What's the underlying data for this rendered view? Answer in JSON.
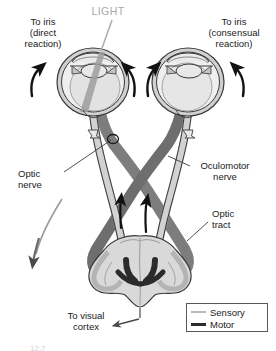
{
  "figure": {
    "background": "#ffffff"
  },
  "labels": {
    "light": "LIGHT",
    "to_iris_direct": "To iris\n(direct\nreaction)",
    "to_iris_consensual": "To iris\n(consensual\nreaction)",
    "optic_nerve": "Optic\nnerve",
    "oculomotor_nerve": "Oculomotor\nnerve",
    "optic_tract": "Optic\ntract",
    "to_visual_cortex": "To visual\ncortex"
  },
  "legend": {
    "position": "bottom-right",
    "items": [
      {
        "label": "Sensory",
        "color": "#b9b9b9",
        "kind": "sensory-line"
      },
      {
        "label": "Motor",
        "color": "#2b2b2b",
        "kind": "motor-line"
      }
    ]
  },
  "caption": {
    "text": "12.7"
  },
  "colors": {
    "sensory": "#8f8f8f",
    "sensory_light": "#b9b9b9",
    "motor": "#4a4a4a",
    "motor_dark": "#2b2b2b",
    "outline": "#3c3c3c",
    "eye_fill": "#e6e6e6",
    "eye_inner": "#efefef",
    "sclera_band": "#c9c9c9",
    "brain_fill": "#dcdcdc",
    "brain_shade": "#c4c4c4",
    "light_text": "#a8a8a8",
    "arrow": "#111111",
    "leader": "#4a4a4a"
  },
  "anatomy": {
    "eyes": [
      {
        "side": "left",
        "cx": 93,
        "cy": 82,
        "rx": 36,
        "ry": 34
      },
      {
        "side": "right",
        "cx": 188,
        "cy": 82,
        "rx": 36,
        "ry": 34
      }
    ],
    "structures": [
      "optic-nerve-left",
      "optic-nerve-right",
      "optic-chiasm",
      "optic-tract-left",
      "optic-tract-right",
      "pretectal-nucleus",
      "edinger-westphal-nucleus",
      "oculomotor-nerve-left",
      "oculomotor-nerve-right",
      "ciliary-ganglion-left",
      "ciliary-ganglion-right",
      "midbrain"
    ],
    "arrows": [
      {
        "name": "iris-arrow-left-outer",
        "direction": "up"
      },
      {
        "name": "iris-arrow-left-inner",
        "direction": "up"
      },
      {
        "name": "iris-arrow-right-inner",
        "direction": "up"
      },
      {
        "name": "iris-arrow-right-outer",
        "direction": "up"
      },
      {
        "name": "tract-arrow-left",
        "direction": "up"
      },
      {
        "name": "tract-arrow-right",
        "direction": "up"
      },
      {
        "name": "sensory-arrow-left-descending",
        "direction": "down"
      },
      {
        "name": "visual-cortex-arrow",
        "direction": "down-left"
      }
    ]
  }
}
